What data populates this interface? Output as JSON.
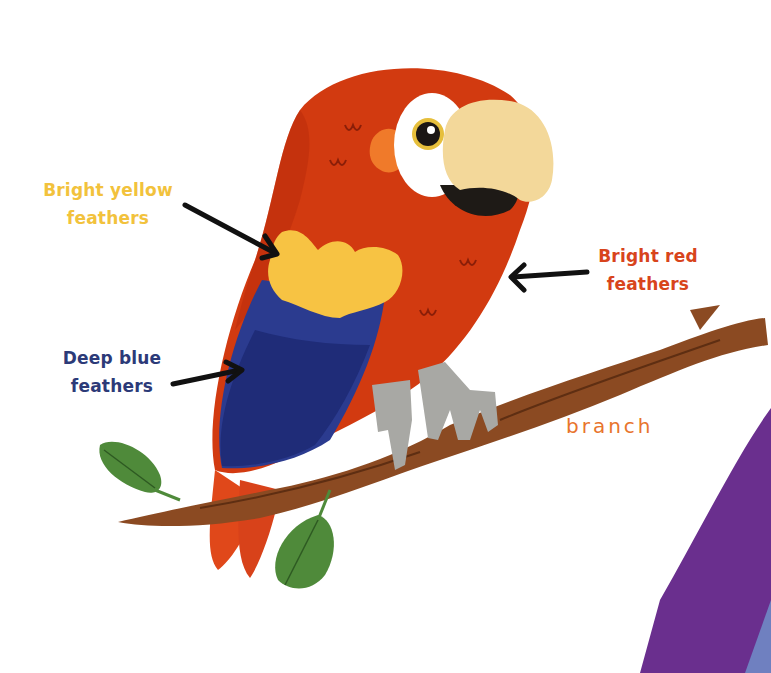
{
  "diagram": {
    "labels": [
      {
        "id": "yellow",
        "lines": [
          "Bright yellow",
          "feathers"
        ],
        "color": "#f2c23c"
      },
      {
        "id": "red",
        "lines": [
          "Bright red",
          "feathers"
        ],
        "color": "#d8441c"
      },
      {
        "id": "blue",
        "lines": [
          "Deep blue",
          "feathers"
        ],
        "color": "#2c3a78"
      },
      {
        "id": "branch",
        "text": "branch",
        "color": "#e8742c"
      }
    ],
    "colors": {
      "body_red": "#d23a10",
      "body_red_dark": "#b52a0c",
      "wing_yellow": "#f7c343",
      "wing_blue": "#2b3b8f",
      "wing_blue_dark": "#1f2c78",
      "beak": "#f3d89a",
      "beak_lower": "#1e1a16",
      "eye_patch": "#ffffff",
      "feet": "#a8a8a4",
      "branch": "#8b4a22",
      "leaf": "#4f8a3a",
      "purple_shape": "#6a2f8e",
      "arrow": "#111111"
    }
  }
}
